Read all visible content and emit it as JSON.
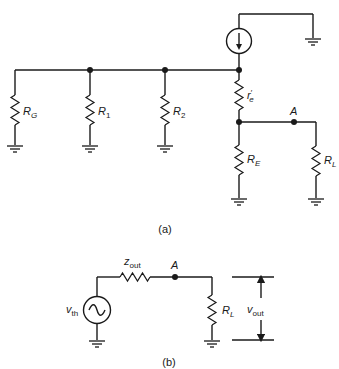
{
  "diagram_a": {
    "caption": "(a)",
    "labels": {
      "rg_main": "R",
      "rg_sub": "G",
      "r1_main": "R",
      "r1_sub": "1",
      "r2_main": "R",
      "r2_sub": "2",
      "re_prime_main": "r",
      "re_prime_sup": "′",
      "re_prime_sub": "e",
      "re_main": "R",
      "re_sub": "E",
      "rl_main": "R",
      "rl_sub": "L",
      "node_a": "A"
    },
    "components": [
      "current-source",
      "R_G",
      "R_1",
      "R_2",
      "r'_e",
      "R_E",
      "R_L",
      "ground x6"
    ]
  },
  "diagram_b": {
    "caption": "(b)",
    "labels": {
      "vth_main": "v",
      "vth_sub": "th",
      "zout_main": "z",
      "zout_sub": "out",
      "node_a": "A",
      "rl_main": "R",
      "rl_sub": "L",
      "vout_main": "v",
      "vout_sub": "out"
    },
    "components": [
      "ac-voltage-source",
      "z_out",
      "R_L",
      "ground x2",
      "v_out arrows"
    ]
  }
}
